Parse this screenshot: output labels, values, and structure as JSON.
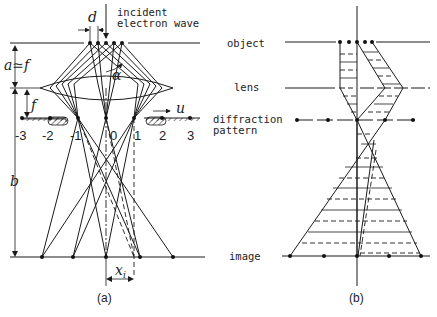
{
  "figure": {
    "panel_a": {
      "caption": "(a)",
      "labels": {
        "d": "d",
        "alpha": "α",
        "a_approx_f": "a≃f",
        "f": "f",
        "b": "b",
        "u": "u",
        "x_i": "x",
        "x_i_sub": "i",
        "incident_line1": "incident",
        "incident_line2": "electron wave"
      },
      "order_labels": [
        "-3",
        "-2",
        "-1",
        "0",
        "1",
        "2",
        "3"
      ]
    },
    "panel_b": {
      "caption": "(b)"
    },
    "plane_labels": {
      "object": "object",
      "lens": "lens",
      "diffraction_line1": "diffraction",
      "diffraction_line2": "pattern",
      "image": "image"
    }
  }
}
